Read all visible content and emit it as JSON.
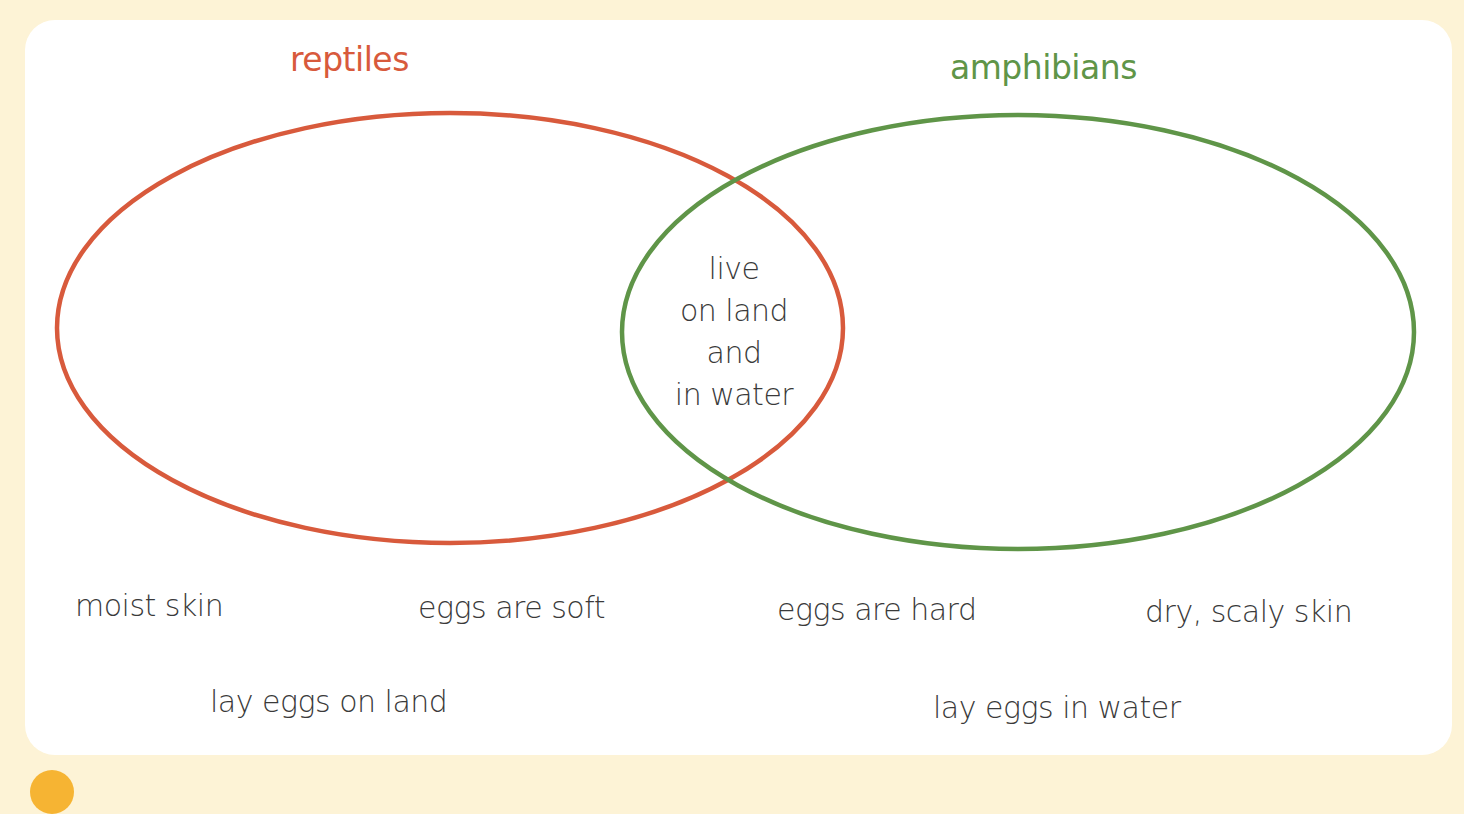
{
  "diagram": {
    "type": "venn",
    "sets": [
      {
        "id": "reptiles",
        "label": "reptiles",
        "color": "#d85a3c"
      },
      {
        "id": "amphibians",
        "label": "amphibians",
        "color": "#5f9548"
      }
    ],
    "intersection": {
      "lines": [
        "live",
        "on land",
        "and",
        "in water"
      ]
    },
    "unsorted_labels": [
      "moist skin",
      "eggs are soft",
      "eggs are hard",
      "dry, scaly skin",
      "lay eggs on land",
      "lay eggs in water"
    ]
  },
  "colors": {
    "page_background": "#fdf3d6",
    "card_background": "#ffffff",
    "text": "#3a3a3a",
    "accent_dot": "#f6b433"
  }
}
